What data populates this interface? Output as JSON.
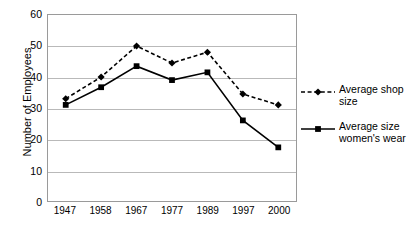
{
  "chart_data": {
    "type": "line",
    "title": "",
    "xlabel": "",
    "ylabel": "Number of Employees",
    "categories": [
      "1947",
      "1958",
      "1967",
      "1977",
      "1989",
      "1997",
      "2000"
    ],
    "ylim": [
      0,
      60
    ],
    "yticks": [
      "0",
      "10",
      "20",
      "30",
      "40",
      "50",
      "60"
    ],
    "grid": true,
    "legend_position": "right",
    "series": [
      {
        "name": "Average shop size",
        "marker": "diamond",
        "linestyle": "dashed",
        "color": "#000000",
        "values": [
          33,
          40,
          50,
          44.5,
          48,
          34.5,
          31
        ]
      },
      {
        "name": "Average size\nwomen's wear",
        "marker": "square",
        "linestyle": "solid",
        "color": "#000000",
        "values": [
          31,
          36.7,
          43.5,
          39,
          41.5,
          26,
          17.3
        ]
      }
    ]
  },
  "axis": {
    "y_title": "Number of Employees"
  },
  "legend": {
    "entries": [
      {
        "label": "Average shop size"
      },
      {
        "label": "Average size\nwomen's wear"
      }
    ]
  }
}
